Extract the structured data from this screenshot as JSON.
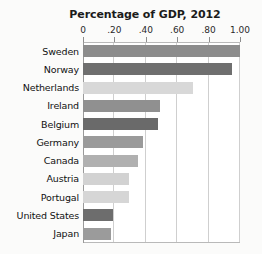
{
  "chart_data": {
    "type": "bar",
    "orientation": "horizontal",
    "title": "Percentage of GDP, 2012",
    "xlabel": "",
    "ylabel": "",
    "xlim": [
      0,
      1.0
    ],
    "grid": true,
    "legend": "none",
    "tick_labels": [
      "0",
      ".20",
      ".40",
      ".60",
      ".80",
      "1.00"
    ],
    "tick_values": [
      0,
      0.2,
      0.4,
      0.6,
      0.8,
      1.0
    ],
    "categories": [
      "Sweden",
      "Norway",
      "Netherlands",
      "Ireland",
      "Belgium",
      "Germany",
      "Canada",
      "Austria",
      "Portugal",
      "United States",
      "Japan"
    ],
    "values": [
      1.0,
      0.95,
      0.7,
      0.49,
      0.48,
      0.38,
      0.35,
      0.29,
      0.29,
      0.19,
      0.18
    ],
    "bar_colors": [
      "#8c8c8c",
      "#6f6f6f",
      "#d8d8d8",
      "#909090",
      "#6a6a6a",
      "#9a9a9a",
      "#b0b0b0",
      "#d2d2d2",
      "#d6d6d6",
      "#6d6d6d",
      "#9b9b9b"
    ]
  },
  "style": {
    "plot_background": "#ffffff",
    "page_background": "#fbfbfa",
    "gridline_color": "#cfcfcf",
    "axis_color": "#9a9a9a",
    "text_color": "#111111"
  }
}
